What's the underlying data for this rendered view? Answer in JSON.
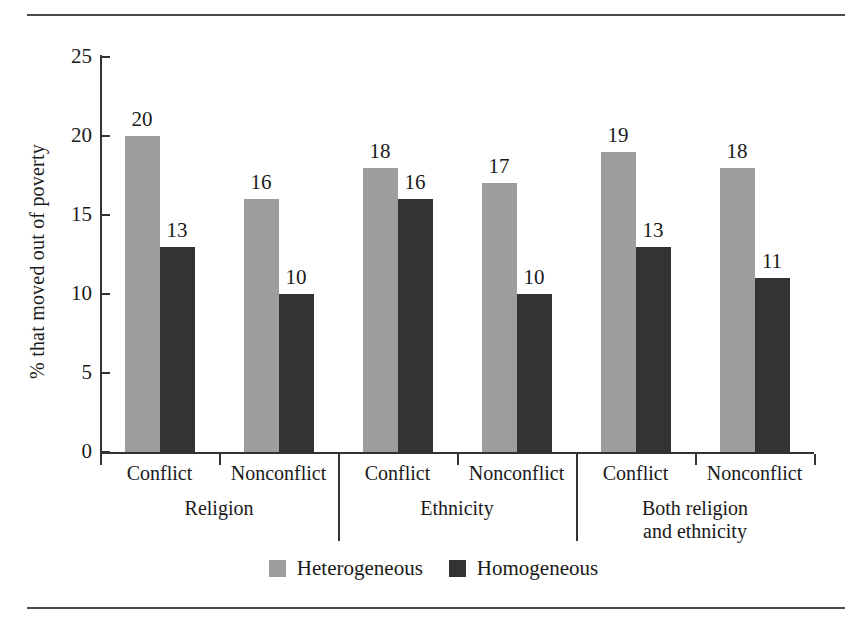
{
  "chart_data": {
    "type": "bar",
    "title": "",
    "xlabel": "",
    "ylabel": "% that moved out of poverty",
    "ylim": [
      0,
      25
    ],
    "yticks": [
      0,
      5,
      10,
      15,
      20,
      25
    ],
    "grid": false,
    "legend_position": "bottom",
    "categories": [
      "Conflict",
      "Nonconflict",
      "Conflict",
      "Nonconflict",
      "Conflict",
      "Nonconflict"
    ],
    "groups": [
      {
        "label": "Religion",
        "label_lines": [
          "Religion"
        ],
        "categories": [
          "Conflict",
          "Nonconflict"
        ]
      },
      {
        "label": "Ethnicity",
        "label_lines": [
          "Ethnicity"
        ],
        "categories": [
          "Conflict",
          "Nonconflict"
        ]
      },
      {
        "label": "Both religion and ethnicity",
        "label_lines": [
          "Both religion",
          "and ethnicity"
        ],
        "categories": [
          "Conflict",
          "Nonconflict"
        ]
      }
    ],
    "series": [
      {
        "name": "Heterogeneous",
        "color": "#9d9d9d",
        "values": [
          20,
          16,
          18,
          17,
          19,
          18
        ]
      },
      {
        "name": "Homogeneous",
        "color": "#333333",
        "values": [
          13,
          10,
          16,
          10,
          13,
          11
        ]
      }
    ]
  },
  "legend": {
    "items": [
      {
        "label": "Heterogeneous",
        "color": "#9d9d9d"
      },
      {
        "label": "Homogeneous",
        "color": "#333333"
      }
    ]
  },
  "axis": {
    "y_label": "% that moved out of poverty",
    "y_ticks": [
      "0",
      "5",
      "10",
      "15",
      "20",
      "25"
    ]
  }
}
